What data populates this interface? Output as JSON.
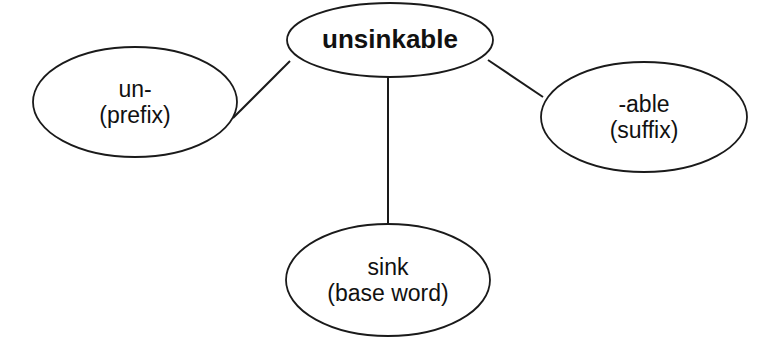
{
  "diagram": {
    "type": "word-web",
    "colors": {
      "stroke": "#1a1a1a",
      "fill": "#ffffff",
      "text": "#111111"
    },
    "center": {
      "id": "unsinkable",
      "label": "unsinkable",
      "cx": 390,
      "cy": 40,
      "rx": 103,
      "ry": 37
    },
    "nodes": [
      {
        "id": "prefix",
        "line1": "un-",
        "line2": "(prefix)",
        "cx": 135,
        "cy": 102,
        "rx": 102,
        "ry": 55
      },
      {
        "id": "suffix",
        "line1": "-able",
        "line2": "(suffix)",
        "cx": 644,
        "cy": 117,
        "rx": 103,
        "ry": 55
      },
      {
        "id": "base",
        "line1": "sink",
        "line2": "(base word)",
        "cx": 388,
        "cy": 280,
        "rx": 102,
        "ry": 56
      }
    ],
    "edges": [
      {
        "from": "unsinkable",
        "to": "prefix",
        "x1": 290,
        "y1": 61,
        "x2": 233,
        "y2": 118
      },
      {
        "from": "unsinkable",
        "to": "suffix",
        "x1": 488,
        "y1": 60,
        "x2": 543,
        "y2": 97
      },
      {
        "from": "unsinkable",
        "to": "base",
        "x1": 388,
        "y1": 77,
        "x2": 388,
        "y2": 224
      }
    ]
  }
}
